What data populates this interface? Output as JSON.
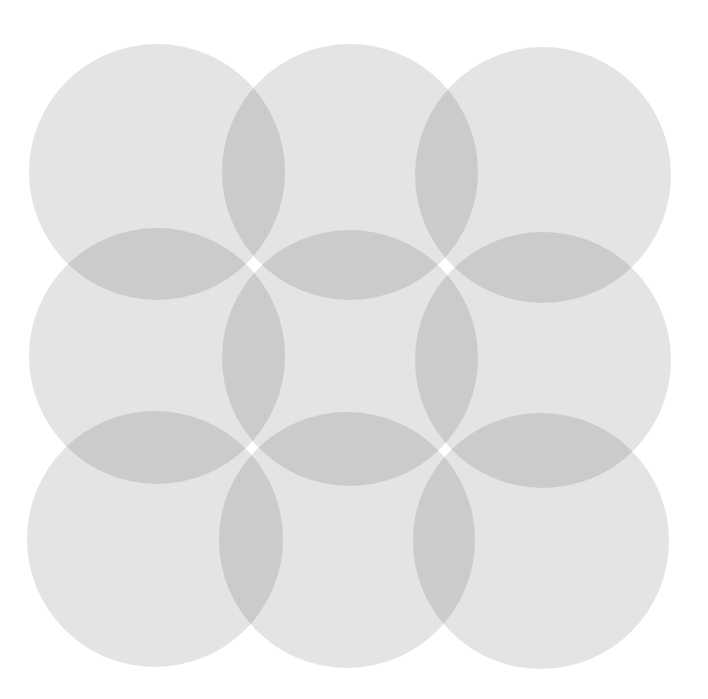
{
  "diagram": {
    "title": "",
    "background_color": "#ffffff",
    "circle_color": "#e4e4e4",
    "overlap_color": "#c9c9c9",
    "circle_diameter": 256,
    "circles": [
      {
        "id": "r1c1",
        "cx": 157,
        "cy": 172
      },
      {
        "id": "r1c2",
        "cx": 350,
        "cy": 172
      },
      {
        "id": "r1c3",
        "cx": 543,
        "cy": 175
      },
      {
        "id": "r2c1",
        "cx": 157,
        "cy": 356
      },
      {
        "id": "r2c2",
        "cx": 350,
        "cy": 358
      },
      {
        "id": "r2c3",
        "cx": 543,
        "cy": 360
      },
      {
        "id": "r3c1",
        "cx": 155,
        "cy": 539
      },
      {
        "id": "r3c2",
        "cx": 347,
        "cy": 540
      },
      {
        "id": "r3c3",
        "cx": 541,
        "cy": 541
      }
    ]
  }
}
